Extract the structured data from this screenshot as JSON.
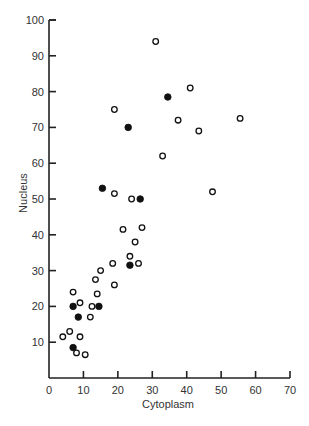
{
  "chart_data": {
    "type": "scatter",
    "title": "",
    "xlabel": "Cytoplasm",
    "ylabel": "Nucleus",
    "xlim": [
      0,
      70
    ],
    "ylim": [
      0,
      100
    ],
    "x_ticks": [
      0,
      10,
      20,
      30,
      40,
      50,
      60,
      70
    ],
    "y_ticks": [
      10,
      20,
      30,
      40,
      50,
      60,
      70,
      80,
      90,
      100
    ],
    "grid": false,
    "legend": null,
    "series": [
      {
        "name": "open",
        "marker": "open-circle",
        "points": [
          [
            31,
            94
          ],
          [
            41,
            81
          ],
          [
            19,
            75
          ],
          [
            37.5,
            72
          ],
          [
            55.5,
            72.5
          ],
          [
            43.5,
            69
          ],
          [
            33,
            62
          ],
          [
            19,
            51.5
          ],
          [
            47.5,
            52
          ],
          [
            24,
            50
          ],
          [
            21.5,
            41.5
          ],
          [
            27,
            42
          ],
          [
            25,
            38
          ],
          [
            23.5,
            34
          ],
          [
            26,
            32
          ],
          [
            18.5,
            32
          ],
          [
            15,
            30
          ],
          [
            13.5,
            27.5
          ],
          [
            19,
            26
          ],
          [
            7,
            24
          ],
          [
            14,
            23.5
          ],
          [
            9,
            21
          ],
          [
            12.5,
            20
          ],
          [
            12,
            17
          ],
          [
            6,
            13
          ],
          [
            4,
            11.5
          ],
          [
            9,
            11.5
          ],
          [
            8,
            7
          ],
          [
            10.5,
            6.5
          ]
        ]
      },
      {
        "name": "filled",
        "marker": "filled-circle",
        "points": [
          [
            34.5,
            78.5
          ],
          [
            23,
            70
          ],
          [
            15.5,
            53
          ],
          [
            26.5,
            50
          ],
          [
            23.5,
            31.5
          ],
          [
            7,
            20
          ],
          [
            14.5,
            20
          ],
          [
            8.5,
            17
          ],
          [
            7,
            8.5
          ]
        ]
      }
    ]
  },
  "colors": {
    "axis": "#222222",
    "marker": "#111111",
    "background": "#ffffff"
  }
}
